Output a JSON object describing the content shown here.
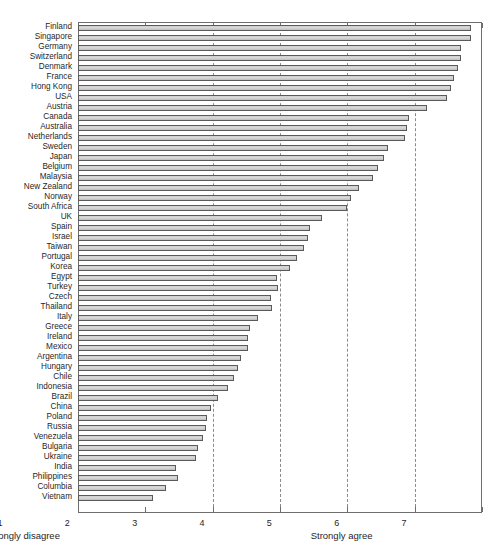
{
  "chart_data": {
    "type": "bar",
    "orientation": "horizontal",
    "title": "",
    "xlabel": "",
    "ylabel": "",
    "xlim": [
      1,
      7
    ],
    "xticks": [
      1,
      2,
      3,
      4,
      5,
      6,
      7
    ],
    "xtick_labels": [
      "1",
      "2",
      "3",
      "4",
      "5",
      "6",
      "7"
    ],
    "gridlines_at": [
      3,
      4,
      5,
      6
    ],
    "grid": true,
    "legend": null,
    "axis_anchor_low": "Strongly disagree",
    "axis_anchor_high": "Strongly agree",
    "bar_face_color": "#d4d4d4",
    "bar_edge_color": "#5a5a5a",
    "categories": [
      "Finland",
      "Singapore",
      "Germany",
      "Switzerland",
      "Denmark",
      "France",
      "Hong Kong",
      "USA",
      "Austria",
      "Canada",
      "Australia",
      "Netherlands",
      "Sweden",
      "Japan",
      "Belgium",
      "Malaysia",
      "New Zealand",
      "Norway",
      "South Africa",
      "UK",
      "Spain",
      "Israel",
      "Taiwan",
      "Portugal",
      "Korea",
      "Egypt",
      "Turkey",
      "Czech",
      "Thailand",
      "Italy",
      "Greece",
      "Ireland",
      "Mexico",
      "Argentina",
      "Hungary",
      "Chile",
      "Indonesia",
      "Brazil",
      "China",
      "Poland",
      "Russia",
      "Venezuela",
      "Bulgaria",
      "Ukraine",
      "India",
      "Philippines",
      "Columbia",
      "Vietnam"
    ],
    "values": [
      6.83,
      6.83,
      6.69,
      6.69,
      6.65,
      6.58,
      6.54,
      6.48,
      6.18,
      5.92,
      5.88,
      5.85,
      5.6,
      5.54,
      5.45,
      5.38,
      5.18,
      5.05,
      5.0,
      4.62,
      4.45,
      4.42,
      4.35,
      4.25,
      4.15,
      3.95,
      3.97,
      3.86,
      3.88,
      3.68,
      3.55,
      3.52,
      3.52,
      3.42,
      3.38,
      3.32,
      3.23,
      3.08,
      2.98,
      2.92,
      2.9,
      2.85,
      2.78,
      2.75,
      2.45,
      2.48,
      2.3,
      2.12
    ]
  }
}
